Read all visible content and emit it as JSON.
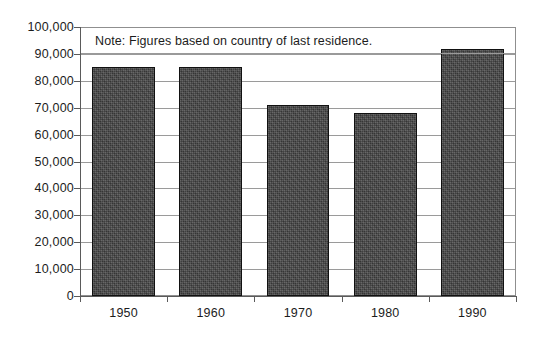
{
  "chart_data": {
    "type": "bar",
    "title": "",
    "subtitle": "",
    "annotation": "Note: Figures based on country of last residence.",
    "xlabel": "",
    "ylabel": "",
    "categories": [
      "1950",
      "1960",
      "1970",
      "1980",
      "1990"
    ],
    "values": [
      85000,
      85000,
      71000,
      68000,
      92000
    ],
    "series": [
      {
        "name": "Immigrants",
        "values": [
          85000,
          85000,
          71000,
          68000,
          92000
        ]
      }
    ],
    "ylim": [
      0,
      100000
    ],
    "ytick_values": [
      0,
      10000,
      20000,
      30000,
      40000,
      50000,
      60000,
      70000,
      80000,
      90000,
      100000
    ],
    "ytick_labels": [
      "0",
      "10,000",
      "20,000",
      "30,000",
      "40,000",
      "50,000",
      "60,000",
      "70,000",
      "80,000",
      "90,000",
      "100,000"
    ],
    "grid": true,
    "grid_axis": "y",
    "legend": false,
    "legend_position": "none",
    "colors": {
      "bar_fill": "#454545",
      "bar_border": "#111111",
      "gridline": "#9a9a9a",
      "axis": "#5a5a5a",
      "text": "#1c1c1c",
      "background": "#ffffff"
    }
  }
}
